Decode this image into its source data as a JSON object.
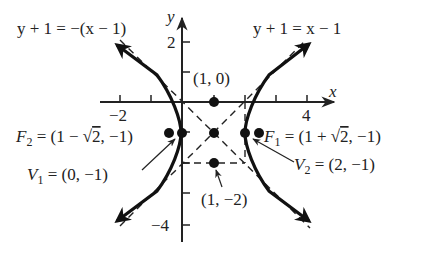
{
  "figure": {
    "type": "hyperbola",
    "equation": "(x-1)^2 - (y+1)^2 = 1",
    "center": [
      1,
      -1
    ],
    "axes": {
      "x_label": "x",
      "y_label": "y",
      "x_ticks": [
        -2,
        -1,
        1,
        2,
        3,
        4
      ],
      "x_tick_labels": [
        {
          "value": -2,
          "text": "−2"
        },
        {
          "value": 4,
          "text": "4"
        }
      ],
      "y_ticks": [
        2,
        1,
        -1,
        -2,
        -3,
        -4
      ],
      "y_tick_labels": [
        {
          "value": 2,
          "text": "2"
        },
        {
          "value": -4,
          "text": "−4"
        }
      ]
    },
    "asymptotes": [
      {
        "label": "y + 1 = −(x − 1)",
        "slope": -1
      },
      {
        "label": "y + 1 = x − 1",
        "slope": 1
      }
    ],
    "points": [
      {
        "name": "top-of-box",
        "label": "(1, 0)",
        "coords": [
          1,
          0
        ]
      },
      {
        "name": "center",
        "label": "",
        "coords": [
          1,
          -1
        ]
      },
      {
        "name": "bottom-of-box",
        "label": "(1, −2)",
        "coords": [
          1,
          -2
        ]
      },
      {
        "name": "vertex-1",
        "label": "V₁ = (0, −1)",
        "sym": "V",
        "sub": "1",
        "rest": " = (0, −1)",
        "coords": [
          0,
          -1
        ]
      },
      {
        "name": "vertex-2",
        "label": "V₂ = (2, −1)",
        "sym": "V",
        "sub": "2",
        "rest": " = (2, −1)",
        "coords": [
          2,
          -1
        ]
      },
      {
        "name": "focus-1",
        "label": "F₁ = (1 + √2, −1)",
        "sym": "F",
        "sub": "1",
        "rest_a": " = (1 + ",
        "sqrt": "2",
        "rest_b": ", −1)",
        "coords": [
          2.414,
          -1
        ]
      },
      {
        "name": "focus-2",
        "label": "F₂ = (1 − √2, −1)",
        "sym": "F",
        "sub": "2",
        "rest_a": " = (1 − ",
        "sqrt": "2",
        "rest_b": ", −1)",
        "coords": [
          -0.414,
          -1
        ]
      }
    ]
  }
}
